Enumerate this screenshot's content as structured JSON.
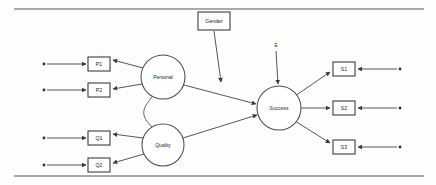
{
  "figure": {
    "type": "path-diagram",
    "rules": {
      "top_rule": "horizontal-rule",
      "bottom_rule": "horizontal-rule"
    }
  },
  "latent_variables": [
    {
      "id": "personal",
      "label": "Personal",
      "cx": 163,
      "cy": 77,
      "r": 22
    },
    {
      "id": "quality",
      "label": "Quality",
      "cx": 163,
      "cy": 145,
      "r": 21
    },
    {
      "id": "success",
      "label": "Success",
      "cx": 279,
      "cy": 108,
      "r": 22
    }
  ],
  "observed_variables": [
    {
      "id": "p1",
      "label": "P1",
      "x": 88,
      "y": 57,
      "w": 22,
      "h": 14
    },
    {
      "id": "p2",
      "label": "P2",
      "x": 88,
      "y": 83,
      "w": 22,
      "h": 14
    },
    {
      "id": "q1",
      "label": "Q1",
      "x": 88,
      "y": 131,
      "w": 22,
      "h": 14
    },
    {
      "id": "q2",
      "label": "Q2",
      "x": 88,
      "y": 158,
      "w": 22,
      "h": 14
    },
    {
      "id": "s1",
      "label": "S1",
      "x": 333,
      "y": 62,
      "w": 22,
      "h": 14
    },
    {
      "id": "s2",
      "label": "S2",
      "x": 333,
      "y": 101,
      "w": 22,
      "h": 14
    },
    {
      "id": "s3",
      "label": "S3",
      "x": 333,
      "y": 140,
      "w": 22,
      "h": 14
    }
  ],
  "exogenous_variables": [
    {
      "id": "gender",
      "label": "Gender",
      "x": 198,
      "y": 12,
      "w": 32,
      "h": 18,
      "kind": "box"
    }
  ],
  "disturbance_terms": [
    {
      "id": "e",
      "label": "E",
      "x": 276,
      "y": 46,
      "kind": "text"
    }
  ],
  "measurement_errors": [
    {
      "id": "e-p1",
      "target": "p1",
      "cx": 44,
      "cy": 64
    },
    {
      "id": "e-p2",
      "target": "p2",
      "cx": 44,
      "cy": 90
    },
    {
      "id": "e-q1",
      "target": "q1",
      "cx": 44,
      "cy": 138
    },
    {
      "id": "e-q2",
      "target": "q2",
      "cx": 44,
      "cy": 165
    },
    {
      "id": "e-s1",
      "target": "s1",
      "cx": 400,
      "cy": 69
    },
    {
      "id": "e-s2",
      "target": "s2",
      "cx": 400,
      "cy": 108
    },
    {
      "id": "e-s3",
      "target": "s3",
      "cx": 400,
      "cy": 147
    }
  ],
  "paths": [
    {
      "id": "personal-to-p1",
      "from": "personal",
      "to": "p1",
      "kind": "directed"
    },
    {
      "id": "personal-to-p2",
      "from": "personal",
      "to": "p2",
      "kind": "directed"
    },
    {
      "id": "quality-to-q1",
      "from": "quality",
      "to": "q1",
      "kind": "directed"
    },
    {
      "id": "quality-to-q2",
      "from": "quality",
      "to": "q2",
      "kind": "directed"
    },
    {
      "id": "personal-to-success",
      "from": "personal",
      "to": "success",
      "kind": "directed"
    },
    {
      "id": "quality-to-success",
      "from": "quality",
      "to": "success",
      "kind": "directed"
    },
    {
      "id": "gender-to-success",
      "from": "gender",
      "to": "success",
      "kind": "directed"
    },
    {
      "id": "e-to-success",
      "from": "e",
      "to": "success",
      "kind": "directed"
    },
    {
      "id": "success-to-s1",
      "from": "success",
      "to": "s1",
      "kind": "directed"
    },
    {
      "id": "success-to-s2",
      "from": "success",
      "to": "s2",
      "kind": "directed"
    },
    {
      "id": "success-to-s3",
      "from": "success",
      "to": "s3",
      "kind": "directed"
    },
    {
      "id": "personal-quality-correlation",
      "from": "personal",
      "to": "quality",
      "kind": "curved"
    }
  ]
}
